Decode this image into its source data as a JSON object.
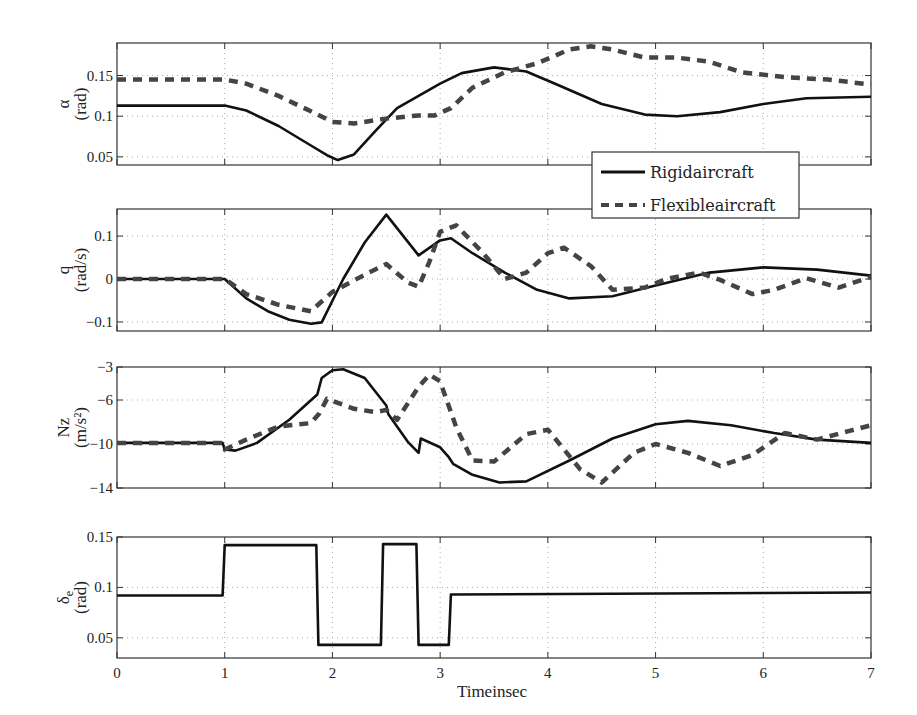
{
  "chart_data": [
    {
      "type": "line",
      "id": "alpha",
      "ylabel": "α",
      "yunit": "(rad)",
      "ylim": [
        0.04,
        0.19
      ],
      "yticks": [
        0.05,
        0.1,
        0.15
      ],
      "ytick_labels": [
        "0.05",
        "0.1",
        "0.15"
      ],
      "xlim": [
        0,
        7
      ],
      "xticks": [
        0,
        1,
        2,
        3,
        4,
        5,
        6,
        7
      ],
      "grid": true,
      "box": {
        "top": 43,
        "bottom": 165
      },
      "series": [
        {
          "name": "Rigidaircraft",
          "style": "solid",
          "x": [
            0,
            1,
            1.2,
            1.5,
            1.8,
            1.95,
            2.05,
            2.2,
            2.4,
            2.6,
            2.8,
            3.0,
            3.2,
            3.5,
            3.8,
            4.1,
            4.5,
            4.9,
            5.2,
            5.6,
            6.0,
            6.4,
            7.0
          ],
          "y": [
            0.113,
            0.113,
            0.107,
            0.088,
            0.064,
            0.052,
            0.046,
            0.053,
            0.082,
            0.11,
            0.125,
            0.14,
            0.153,
            0.16,
            0.155,
            0.138,
            0.115,
            0.102,
            0.1,
            0.105,
            0.115,
            0.122,
            0.124
          ]
        },
        {
          "name": "Flexibleaircraft",
          "style": "dashed",
          "x": [
            0,
            1,
            1.2,
            1.5,
            1.8,
            2.0,
            2.2,
            2.5,
            2.8,
            2.95,
            3.1,
            3.3,
            3.6,
            3.9,
            4.2,
            4.4,
            4.6,
            4.9,
            5.2,
            5.5,
            5.8,
            6.2,
            6.6,
            7.0
          ],
          "y": [
            0.145,
            0.145,
            0.14,
            0.125,
            0.106,
            0.093,
            0.091,
            0.097,
            0.101,
            0.101,
            0.11,
            0.135,
            0.154,
            0.165,
            0.182,
            0.186,
            0.182,
            0.172,
            0.172,
            0.167,
            0.154,
            0.148,
            0.145,
            0.139
          ]
        }
      ]
    },
    {
      "type": "line",
      "id": "q",
      "ylabel": "q",
      "yunit": "(rad/s)",
      "ylim": [
        -0.121,
        0.163
      ],
      "yticks": [
        -0.1,
        0,
        0.1
      ],
      "ytick_labels": [
        "-0.1",
        "0",
        "0.1"
      ],
      "xlim": [
        0,
        7
      ],
      "xticks": [
        0,
        1,
        2,
        3,
        4,
        5,
        6,
        7
      ],
      "grid": true,
      "box": {
        "top": 209,
        "bottom": 331
      },
      "series": [
        {
          "name": "Rigidaircraft",
          "style": "solid",
          "x": [
            0,
            1,
            1.2,
            1.4,
            1.6,
            1.8,
            1.9,
            2.1,
            2.3,
            2.5,
            2.8,
            3.0,
            3.1,
            3.3,
            3.6,
            3.9,
            4.2,
            4.6,
            5.0,
            5.5,
            6.0,
            6.5,
            7.0
          ],
          "y": [
            0.0,
            0.0,
            -0.045,
            -0.075,
            -0.095,
            -0.104,
            -0.101,
            0.0,
            0.085,
            0.15,
            0.055,
            0.09,
            0.095,
            0.06,
            0.015,
            -0.025,
            -0.045,
            -0.04,
            -0.015,
            0.015,
            0.027,
            0.022,
            0.008
          ]
        },
        {
          "name": "Flexibleaircraft",
          "style": "dashed",
          "x": [
            0,
            1,
            1.2,
            1.5,
            1.8,
            2.0,
            2.3,
            2.5,
            2.7,
            2.8,
            2.9,
            3.0,
            3.15,
            3.4,
            3.6,
            3.8,
            4.0,
            4.15,
            4.4,
            4.6,
            4.9,
            5.1,
            5.4,
            5.6,
            5.9,
            6.1,
            6.4,
            6.7,
            7.0
          ],
          "y": [
            0.0,
            0.0,
            -0.035,
            -0.06,
            -0.075,
            -0.03,
            0.01,
            0.035,
            -0.008,
            -0.018,
            0.04,
            0.11,
            0.125,
            0.06,
            0.0,
            0.015,
            0.06,
            0.073,
            0.03,
            -0.025,
            -0.02,
            0.0,
            0.015,
            -0.002,
            -0.035,
            -0.025,
            0.002,
            -0.02,
            0.005
          ]
        }
      ]
    },
    {
      "type": "line",
      "id": "nz",
      "ylabel": "Nz",
      "yunit": "(m/s²)",
      "ylim": [
        -14,
        -3
      ],
      "yticks": [
        -14,
        -10,
        -6,
        -3
      ],
      "ytick_labels": [
        "-14",
        "-10",
        "-6",
        "-3"
      ],
      "xlim": [
        0,
        7
      ],
      "xticks": [
        0,
        1,
        2,
        3,
        4,
        5,
        6,
        7
      ],
      "grid": true,
      "box": {
        "top": 367,
        "bottom": 488
      },
      "series": [
        {
          "name": "Rigidaircraft",
          "style": "solid",
          "x": [
            0,
            0.98,
            1.0,
            1.1,
            1.3,
            1.6,
            1.86,
            1.9,
            2.0,
            2.1,
            2.3,
            2.5,
            2.52,
            2.7,
            2.8,
            2.82,
            3.0,
            3.08,
            3.12,
            3.3,
            3.55,
            3.8,
            4.2,
            4.6,
            5.0,
            5.3,
            5.7,
            6.1,
            6.5,
            7.0
          ],
          "y": [
            -9.9,
            -9.9,
            -10.5,
            -10.6,
            -9.9,
            -7.8,
            -5.5,
            -4.0,
            -3.3,
            -3.2,
            -4.0,
            -6.5,
            -7.3,
            -9.8,
            -10.8,
            -9.5,
            -10.3,
            -11.2,
            -11.8,
            -12.8,
            -13.5,
            -13.4,
            -11.5,
            -9.5,
            -8.2,
            -7.9,
            -8.3,
            -9.0,
            -9.6,
            -9.9
          ]
        },
        {
          "name": "Flexibleaircraft",
          "style": "dashed",
          "x": [
            0,
            0.98,
            1.0,
            1.2,
            1.5,
            1.8,
            1.88,
            1.95,
            2.2,
            2.4,
            2.5,
            2.6,
            2.8,
            2.9,
            3.0,
            3.15,
            3.3,
            3.5,
            3.8,
            4.0,
            4.3,
            4.5,
            4.8,
            5.0,
            5.3,
            5.6,
            5.9,
            6.2,
            6.5,
            6.8,
            7.0
          ],
          "y": [
            -9.9,
            -9.9,
            -10.5,
            -9.6,
            -8.4,
            -8.1,
            -7.2,
            -5.9,
            -6.8,
            -7.1,
            -6.9,
            -7.8,
            -4.8,
            -3.7,
            -4.3,
            -8.5,
            -11.5,
            -11.6,
            -9.1,
            -8.7,
            -12.3,
            -13.5,
            -10.8,
            -10.0,
            -10.8,
            -12.0,
            -11.0,
            -9.0,
            -9.6,
            -8.8,
            -8.3
          ]
        }
      ]
    },
    {
      "type": "line",
      "id": "delta_e",
      "ylabel": "δe",
      "yunit": "(rad)",
      "ylim": [
        0.03,
        0.15
      ],
      "yticks": [
        0.05,
        0.1,
        0.15
      ],
      "ytick_labels": [
        "0.05",
        "0.1",
        "0.15"
      ],
      "xlim": [
        0,
        7
      ],
      "xticks": [
        0,
        1,
        2,
        3,
        4,
        5,
        6,
        7
      ],
      "xtick_labels": [
        "0",
        "1",
        "2",
        "3",
        "4",
        "5",
        "6",
        "7"
      ],
      "xlabel": "Timeinsec",
      "grid": true,
      "box": {
        "top": 537,
        "bottom": 658
      },
      "series": [
        {
          "name": "Rigidaircraft",
          "style": "solid",
          "x": [
            0,
            0.98,
            1.0,
            1.85,
            1.87,
            2.45,
            2.47,
            2.78,
            2.8,
            3.08,
            3.1,
            7.0
          ],
          "y": [
            0.092,
            0.092,
            0.142,
            0.142,
            0.043,
            0.043,
            0.143,
            0.143,
            0.043,
            0.043,
            0.093,
            0.095
          ]
        }
      ]
    }
  ],
  "legend": {
    "entries": [
      {
        "label": "Rigidaircraft",
        "style": "solid"
      },
      {
        "label": "Flexibleaircraft",
        "style": "dashed"
      }
    ]
  },
  "colors": {
    "rigid": "#111111",
    "flexible": "#444444",
    "axis": "#333333",
    "grid": "#aaaaaa"
  }
}
